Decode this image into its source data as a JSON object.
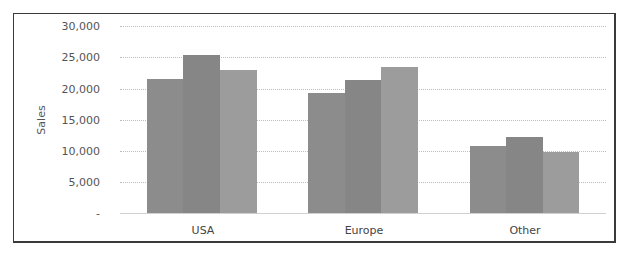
{
  "chart_data": {
    "type": "bar",
    "title": "",
    "xlabel": "",
    "ylabel": "Sales",
    "ylim": [
      0,
      30000
    ],
    "yticks": [
      0,
      5000,
      10000,
      15000,
      20000,
      25000,
      30000
    ],
    "ytick_labels": [
      "-",
      "5,000",
      "10,000",
      "15,000",
      "20,000",
      "25,000",
      "30,000"
    ],
    "grid": true,
    "legend": null,
    "categories": [
      "USA",
      "Europe",
      "Other"
    ],
    "series": [
      {
        "name": "Series 1",
        "color": "#8c8c8c",
        "values": [
          21500,
          19300,
          10800
        ]
      },
      {
        "name": "Series 2",
        "color": "#868686",
        "values": [
          25300,
          21300,
          12200
        ]
      },
      {
        "name": "Series 3",
        "color": "#9c9c9c",
        "values": [
          23000,
          23500,
          9800
        ]
      }
    ]
  },
  "axis": {
    "y_title": "Sales",
    "ticks": [
      {
        "label": "30,000",
        "value": 30000
      },
      {
        "label": "25,000",
        "value": 25000
      },
      {
        "label": "20,000",
        "value": 20000
      },
      {
        "label": "15,000",
        "value": 15000
      },
      {
        "label": "10,000",
        "value": 10000
      },
      {
        "label": "5,000",
        "value": 5000
      },
      {
        "label": "-",
        "value": 0
      }
    ]
  },
  "categories": [
    {
      "label": "USA"
    },
    {
      "label": "Europe"
    },
    {
      "label": "Other"
    }
  ]
}
